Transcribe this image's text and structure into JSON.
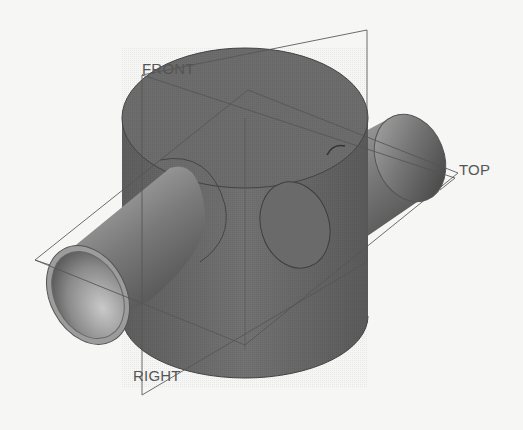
{
  "viewport": {
    "title": "3D model view - cylinder with cross pipe",
    "background": "#f6f6f4"
  },
  "datum_planes": [
    {
      "name": "FRONT",
      "label": "FRONT",
      "x": 142,
      "y": 60
    },
    {
      "name": "TOP",
      "label": "TOP",
      "x": 459,
      "y": 160
    },
    {
      "name": "RIGHT",
      "label": "RIGHT",
      "x": 133,
      "y": 366
    }
  ],
  "colors": {
    "body": "#6e6e6e",
    "body_dark": "#5a5a5a",
    "pipe_light": "#b8b8b8",
    "pipe_dark": "#5c5c5c",
    "edge": "#3a3a3a",
    "datum_line": "#5a5a5a",
    "label": "#555555"
  }
}
